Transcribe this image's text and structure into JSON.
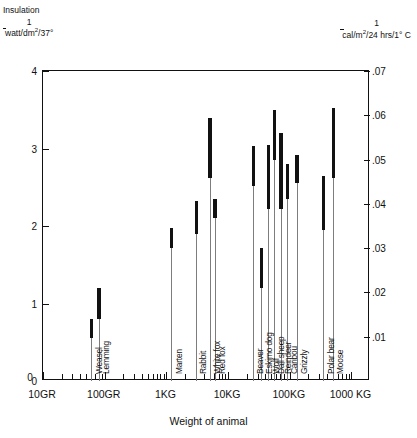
{
  "header": {
    "left_title": "Insulation",
    "left_numerator": "1",
    "left_denominator": "watt/dm2/37°",
    "left_den_base": "watt/dm",
    "left_den_sup": "2",
    "left_den_tail": "/37°",
    "right_numerator": "1",
    "right_den_base": "cal/m",
    "right_den_sup": "2",
    "right_den_tail": "/24 hrs/1° C"
  },
  "axis": {
    "y_left_ticks": [
      "0",
      "1",
      "2",
      "3",
      "4"
    ],
    "y_right_ticks": [
      ".01",
      ".02",
      ".03",
      ".04",
      ".05",
      ".06",
      ".07"
    ],
    "x_labels": [
      "10GR",
      "100GR",
      "1KG",
      "10KG",
      "100KG",
      "1000 KG"
    ],
    "x_title": "Weight of animal",
    "zero_label": "0"
  },
  "chart_data": {
    "type": "bar",
    "xlabel": "Weight of animal",
    "ylabel": "Insulation  1/(watt/dm2/37°)",
    "ylabel_right": "1/(cal/m2/24 hrs/1° C)",
    "xscale": "log",
    "xlim": [
      10,
      2000
    ],
    "xunits": "grams (10GR to 1000 KG)",
    "ylim": [
      0,
      4
    ],
    "ylim_right": [
      0,
      0.07
    ],
    "grid": false,
    "legend": null,
    "note": "Each animal is drawn as a thin leader line from the x-axis up to a thick vertical bar spanning the measured insulation range.",
    "categories": [
      "Weasel",
      "Lemming",
      "Marten",
      "Rabbit",
      "White fox",
      "Red fox",
      "Beaver",
      "Eskimo dog",
      "Wolf",
      "Dall sheep",
      "Reindeer",
      "Caribou",
      "Grizzly",
      "Polar bear",
      "Moose"
    ],
    "points": [
      {
        "name": "Weasel",
        "weight_label": "~60 GR",
        "x_log": 1.78,
        "low": 0.55,
        "high": 0.8
      },
      {
        "name": "Lemming",
        "weight_label": "~80 GR",
        "x_log": 1.9,
        "low": 0.8,
        "high": 1.2
      },
      {
        "name": "Marten",
        "weight_label": "~1.2 KG",
        "x_log": 3.08,
        "low": 1.72,
        "high": 1.97
      },
      {
        "name": "Rabbit",
        "weight_label": "~3 KG",
        "x_log": 3.48,
        "low": 1.9,
        "high": 2.32
      },
      {
        "name": "White fox",
        "weight_label": "~5 KG",
        "x_log": 3.7,
        "low": 2.62,
        "high": 3.4
      },
      {
        "name": "Red fox",
        "weight_label": "~6 KG",
        "x_log": 3.78,
        "low": 2.1,
        "high": 2.35
      },
      {
        "name": "Beaver",
        "weight_label": "~25 KG",
        "x_log": 4.4,
        "low": 2.52,
        "high": 3.03
      },
      {
        "name": "Eskimo dog",
        "weight_label": "~35 KG",
        "x_log": 4.54,
        "low": 1.2,
        "high": 1.72
      },
      {
        "name": "Wolf",
        "weight_label": "~45 KG",
        "x_log": 4.65,
        "low": 2.22,
        "high": 3.05
      },
      {
        "name": "Dall sheep",
        "weight_label": "~55 KG",
        "x_log": 4.74,
        "low": 2.85,
        "high": 3.5
      },
      {
        "name": "Reindeer",
        "weight_label": "~70 KG",
        "x_log": 4.85,
        "low": 2.22,
        "high": 3.2
      },
      {
        "name": "Caribou",
        "weight_label": "~90 KG",
        "x_log": 4.95,
        "low": 2.35,
        "high": 2.8
      },
      {
        "name": "Grizzly",
        "weight_label": "~130 KG",
        "x_log": 5.11,
        "low": 2.55,
        "high": 2.92
      },
      {
        "name": "Polar bear",
        "weight_label": "~350 KG",
        "x_log": 5.54,
        "low": 1.95,
        "high": 2.65
      },
      {
        "name": "Moose",
        "weight_label": "~500 KG",
        "x_log": 5.7,
        "low": 2.62,
        "high": 3.52
      }
    ]
  }
}
